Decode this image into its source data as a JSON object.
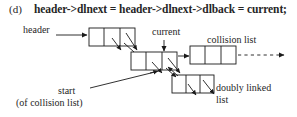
{
  "figure": {
    "panel_letter": "(d)",
    "equation": "header->dlnext = header->dlnext->dlback = current;",
    "labels": {
      "header": "header",
      "current": "current",
      "collision_list": "collision list",
      "start": "start",
      "start_sub": "(of collision list)",
      "doubly_linked_1": "doubly linked",
      "doubly_linked_2": "list"
    },
    "colors": {
      "ink": "#262626",
      "line": "#1a1a1a",
      "background": "#ffffff"
    },
    "nodes": [
      {
        "name": "header-node",
        "x": 89,
        "y": 28,
        "w": 46,
        "h": 18,
        "cells": 3
      },
      {
        "name": "current-node",
        "x": 131,
        "y": 52,
        "w": 46,
        "h": 18,
        "cells": 3
      },
      {
        "name": "collision-list-node",
        "x": 190,
        "y": 46,
        "w": 46,
        "h": 18,
        "cells": 3
      },
      {
        "name": "lower-node",
        "x": 172,
        "y": 75,
        "w": 40,
        "h": 18,
        "cells": 3
      }
    ]
  }
}
